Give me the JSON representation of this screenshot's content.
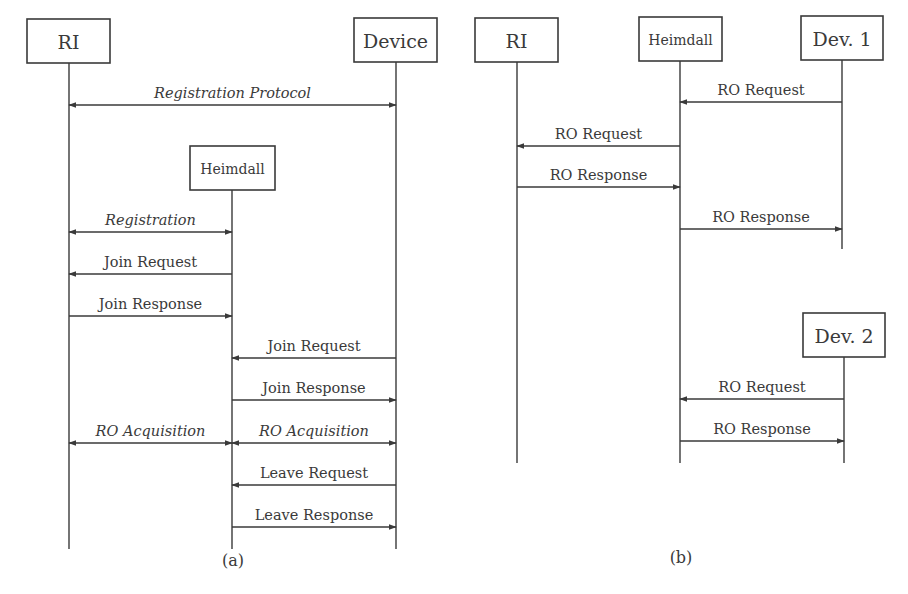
{
  "diagrams": [
    {
      "id": "a",
      "caption": "(a)",
      "caption_pos": [
        233,
        560
      ],
      "participants": [
        {
          "key": "ri",
          "label": "RI",
          "box": [
            27,
            19,
            83,
            44
          ],
          "font_size": 19,
          "lifeline_x": 69,
          "lifeline_end": 549
        },
        {
          "key": "device",
          "label": "Device",
          "box": [
            354,
            18,
            83,
            44
          ],
          "font_size": 19,
          "lifeline_x": 396,
          "lifeline_end": 549
        },
        {
          "key": "heimdall",
          "label": "Heimdall",
          "box": [
            190,
            146,
            85,
            44
          ],
          "font_size": 14,
          "lifeline_x": 232,
          "lifeline_end": 549
        }
      ],
      "messages": [
        {
          "label": "Registration Protocol",
          "from": "ri",
          "to": "device",
          "y": 105,
          "bidirectional": true,
          "italic": true
        },
        {
          "label": "Registration",
          "from": "ri",
          "to": "heimdall",
          "y": 232,
          "bidirectional": true,
          "italic": true
        },
        {
          "label": "Join Request",
          "from": "heimdall",
          "to": "ri",
          "y": 274,
          "bidirectional": false,
          "italic": false
        },
        {
          "label": "Join Response",
          "from": "ri",
          "to": "heimdall",
          "y": 316,
          "bidirectional": false,
          "italic": false
        },
        {
          "label": "Join Request",
          "from": "device",
          "to": "heimdall",
          "y": 358,
          "bidirectional": false,
          "italic": false
        },
        {
          "label": "Join Response",
          "from": "heimdall",
          "to": "device",
          "y": 400,
          "bidirectional": false,
          "italic": false
        },
        {
          "label": "RO Acquisition",
          "from": "ri",
          "to": "heimdall",
          "y": 443,
          "bidirectional": true,
          "italic": true
        },
        {
          "label": "RO Acquisition",
          "from": "heimdall",
          "to": "device",
          "y": 443,
          "bidirectional": true,
          "italic": true
        },
        {
          "label": "Leave Request",
          "from": "device",
          "to": "heimdall",
          "y": 485,
          "bidirectional": false,
          "italic": false
        },
        {
          "label": "Leave Response",
          "from": "heimdall",
          "to": "device",
          "y": 527,
          "bidirectional": false,
          "italic": false
        }
      ]
    },
    {
      "id": "b",
      "caption": "(b)",
      "caption_pos": [
        681,
        557
      ],
      "participants": [
        {
          "key": "ri",
          "label": "RI",
          "box": [
            475,
            18,
            83,
            44
          ],
          "font_size": 19,
          "lifeline_x": 517,
          "lifeline_end": 463
        },
        {
          "key": "heimdall",
          "label": "Heimdall",
          "box": [
            639,
            17,
            83,
            44
          ],
          "font_size": 14,
          "lifeline_x": 680,
          "lifeline_end": 463
        },
        {
          "key": "dev1",
          "label": "Dev. 1",
          "box": [
            801,
            16,
            82,
            44
          ],
          "font_size": 19,
          "lifeline_x": 842,
          "lifeline_end": 249
        },
        {
          "key": "dev2",
          "label": "Dev. 2",
          "box": [
            803,
            313,
            82,
            44
          ],
          "font_size": 19,
          "lifeline_x": 844,
          "lifeline_end": 463
        }
      ],
      "messages": [
        {
          "label": "RO Request",
          "from": "dev1",
          "to": "heimdall",
          "y": 102,
          "bidirectional": false,
          "italic": false
        },
        {
          "label": "RO Request",
          "from": "heimdall",
          "to": "ri",
          "y": 146,
          "bidirectional": false,
          "italic": false
        },
        {
          "label": "RO Response",
          "from": "ri",
          "to": "heimdall",
          "y": 187,
          "bidirectional": false,
          "italic": false
        },
        {
          "label": "RO Response",
          "from": "heimdall",
          "to": "dev1",
          "y": 229,
          "bidirectional": false,
          "italic": false
        },
        {
          "label": "RO Request",
          "from": "dev2",
          "to": "heimdall",
          "y": 399,
          "bidirectional": false,
          "italic": false
        },
        {
          "label": "RO Response",
          "from": "heimdall",
          "to": "dev2",
          "y": 441,
          "bidirectional": false,
          "italic": false
        }
      ]
    }
  ],
  "colors": {
    "ink": "#3a3a3a",
    "background": "#ffffff"
  }
}
